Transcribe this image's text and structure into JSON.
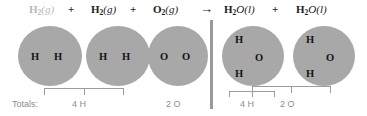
{
  "diagram": {
    "colors": {
      "molecule_fill": "#a8a8a8",
      "atom_text": "#141414",
      "equation_text": "#1c1c1c",
      "faded_text": "#b9b9b9",
      "totals_text": "#8e8e8e",
      "bracket": "#9c9c9c",
      "divider": "#9a9a9a",
      "background": "#ffffff"
    }
  },
  "equation": {
    "terms": [
      {
        "formula": "H",
        "sub": "2",
        "state": "(g)",
        "faded": true
      },
      {
        "formula": "H",
        "sub": "2",
        "state": "(g)",
        "faded": false
      },
      {
        "formula": "O",
        "sub": "2",
        "state": "(g)",
        "faded": false
      },
      {
        "formula": "H",
        "sub": "2",
        "state": "O(l)",
        "faded": false
      },
      {
        "formula": "H",
        "sub": "2",
        "state": "O(l)",
        "faded": false
      }
    ],
    "plus_1": "+",
    "plus_2": "+",
    "plus_3": "+",
    "arrow": "→"
  },
  "molecules": [
    {
      "name": "hydrogen-molecule-1",
      "atoms": [
        {
          "label": "H"
        },
        {
          "label": "H"
        }
      ]
    },
    {
      "name": "hydrogen-molecule-2",
      "atoms": [
        {
          "label": "H"
        },
        {
          "label": "H"
        }
      ]
    },
    {
      "name": "oxygen-molecule",
      "atoms": [
        {
          "label": "O"
        },
        {
          "label": "O"
        }
      ]
    },
    {
      "name": "water-molecule-1",
      "atoms": [
        {
          "label": "H"
        },
        {
          "label": "O"
        },
        {
          "label": "H"
        }
      ]
    },
    {
      "name": "water-molecule-2",
      "atoms": [
        {
          "label": "H"
        },
        {
          "label": "O"
        },
        {
          "label": "H"
        }
      ]
    }
  ],
  "totals": {
    "label": "Totals:",
    "reactant_hydrogen": "4 H",
    "reactant_oxygen": "2 O",
    "product_hydrogen": "4 H",
    "product_oxygen": "2 O"
  }
}
